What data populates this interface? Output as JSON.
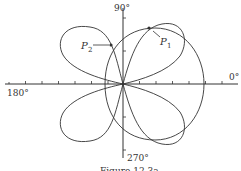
{
  "diagram": {
    "labels": {
      "angle_90": "90°",
      "angle_0": "0°",
      "angle_180": "180°",
      "angle_270": "270°",
      "p1": "P",
      "p1_sub": "1",
      "p2": "P",
      "p2_sub": "2",
      "caption": "Figure 12.3a"
    },
    "curves": [
      "four-petal rose",
      "limaçon"
    ],
    "colors": {
      "stroke": "#333333",
      "background": "#ffffff"
    }
  }
}
